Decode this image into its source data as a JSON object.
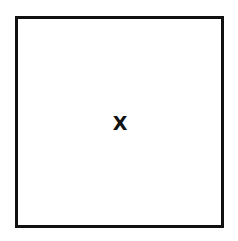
{
  "diagram": {
    "box": {
      "label": "X",
      "border_color": "#111111",
      "fill_color": "#ffffff"
    }
  }
}
